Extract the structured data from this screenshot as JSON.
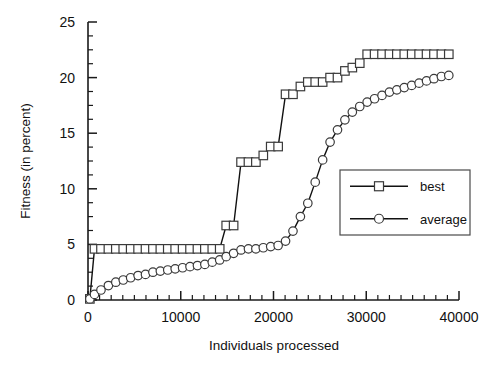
{
  "chart_data": {
    "type": "line",
    "title": "",
    "xlabel": "Individuals processed",
    "ylabel": "Fitness (in percent)",
    "xlim": [
      0,
      40000
    ],
    "ylim": [
      0,
      25
    ],
    "xticks": [
      0,
      10000,
      20000,
      30000,
      40000
    ],
    "xtick_labels": [
      "0",
      "10000",
      "20000",
      "30000",
      "40000"
    ],
    "yticks": [
      0,
      5,
      10,
      15,
      20,
      25
    ],
    "ytick_labels": [
      "0",
      "5",
      "10",
      "15",
      "20",
      "25"
    ],
    "x_minor_tick_interval": 1250,
    "y_minor_tick_interval": 1.25,
    "grid": false,
    "legend_position": "center-right",
    "series": [
      {
        "name": "best",
        "marker": "square",
        "x": [
          200,
          700,
          1400,
          2200,
          3000,
          3800,
          4600,
          5400,
          6200,
          7000,
          7800,
          8600,
          9400,
          10200,
          11000,
          11800,
          12600,
          13400,
          14200,
          14900,
          15700,
          16500,
          17300,
          18100,
          18900,
          19700,
          20500,
          21300,
          22100,
          22900,
          23700,
          24500,
          25300,
          26100,
          26900,
          27700,
          28500,
          29300,
          30100,
          30900,
          31700,
          32500,
          33300,
          34100,
          34900,
          35700,
          36500,
          37300,
          38100,
          38900
        ],
        "y": [
          0.1,
          4.6,
          4.6,
          4.6,
          4.6,
          4.6,
          4.6,
          4.6,
          4.6,
          4.6,
          4.6,
          4.6,
          4.6,
          4.6,
          4.6,
          4.6,
          4.6,
          4.6,
          4.6,
          6.7,
          6.7,
          12.4,
          12.4,
          12.4,
          13.0,
          13.8,
          13.8,
          18.5,
          18.5,
          19.2,
          19.6,
          19.6,
          19.6,
          20.0,
          20.0,
          20.6,
          20.9,
          21.3,
          22.1,
          22.1,
          22.1,
          22.1,
          22.1,
          22.1,
          22.1,
          22.1,
          22.1,
          22.1,
          22.1,
          22.1
        ]
      },
      {
        "name": "average",
        "marker": "circle",
        "x": [
          200,
          700,
          1400,
          2200,
          3000,
          3800,
          4600,
          5400,
          6200,
          7000,
          7800,
          8600,
          9400,
          10200,
          11000,
          11800,
          12600,
          13400,
          14200,
          14900,
          15700,
          16500,
          17300,
          18100,
          18900,
          19700,
          20500,
          21300,
          22100,
          22900,
          23700,
          24500,
          25300,
          26100,
          26900,
          27700,
          28500,
          29300,
          30100,
          30900,
          31700,
          32500,
          33300,
          34100,
          34900,
          35700,
          36500,
          37300,
          38100,
          38900
        ],
        "y": [
          0.1,
          0.5,
          0.9,
          1.3,
          1.6,
          1.8,
          2.0,
          2.2,
          2.3,
          2.5,
          2.6,
          2.7,
          2.8,
          2.9,
          3.0,
          3.1,
          3.2,
          3.4,
          3.6,
          3.9,
          4.2,
          4.5,
          4.6,
          4.6,
          4.7,
          4.8,
          4.9,
          5.3,
          6.2,
          7.5,
          8.7,
          10.6,
          12.6,
          14.2,
          15.3,
          16.2,
          16.9,
          17.4,
          17.8,
          18.1,
          18.4,
          18.7,
          18.9,
          19.1,
          19.3,
          19.5,
          19.7,
          19.9,
          20.1,
          20.2
        ]
      }
    ],
    "legend_entries": [
      {
        "label": "best",
        "marker": "square"
      },
      {
        "label": "average",
        "marker": "circle"
      }
    ]
  },
  "plot_geometry": {
    "left_px": 88,
    "right_px": 459,
    "top_px": 22,
    "bottom_px": 300,
    "legend": {
      "x": 340,
      "y": 170,
      "w": 130,
      "h": 65
    }
  }
}
